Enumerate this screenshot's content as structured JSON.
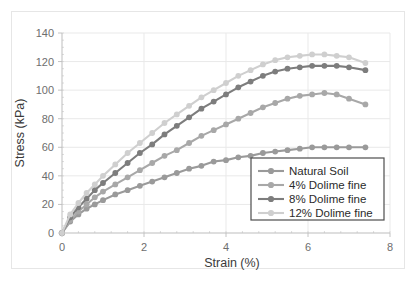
{
  "chart_data": {
    "type": "line",
    "title": "",
    "xlabel": "Strain (%)",
    "ylabel": "Stress (kPa)",
    "xlim": [
      0,
      8
    ],
    "ylim": [
      0,
      140
    ],
    "xticks": [
      0,
      2,
      4,
      6,
      8
    ],
    "yticks": [
      0,
      20,
      40,
      60,
      80,
      100,
      120,
      140
    ],
    "xtick_labels": [
      "0",
      "2",
      "4",
      "6",
      "8"
    ],
    "ytick_labels": [
      "0",
      "20",
      "40",
      "60",
      "80",
      "100",
      "120",
      "140"
    ],
    "grid": true,
    "legend_position": "lower-right",
    "markers": "circle",
    "series": [
      {
        "name": "Natural Soil",
        "color": "#9a9a9a",
        "x": [
          0,
          0.2,
          0.4,
          0.6,
          0.8,
          1.0,
          1.3,
          1.6,
          1.9,
          2.2,
          2.5,
          2.8,
          3.1,
          3.4,
          3.7,
          4.0,
          4.3,
          4.6,
          4.9,
          5.2,
          5.5,
          5.8,
          6.1,
          6.4,
          6.7,
          7.0,
          7.4
        ],
        "y": [
          0,
          8,
          13,
          17,
          20,
          23,
          27,
          30,
          33,
          36,
          39,
          42,
          45,
          47,
          50,
          51,
          53,
          54,
          56,
          57,
          58,
          59,
          60,
          60,
          60,
          60,
          60
        ]
      },
      {
        "name": "4% Dolime fine",
        "color": "#a8a8a8",
        "x": [
          0,
          0.2,
          0.4,
          0.6,
          0.8,
          1.0,
          1.3,
          1.6,
          1.9,
          2.2,
          2.5,
          2.8,
          3.1,
          3.4,
          3.7,
          4.0,
          4.3,
          4.6,
          4.9,
          5.2,
          5.5,
          5.8,
          6.1,
          6.4,
          6.7,
          7.0,
          7.4
        ],
        "y": [
          0,
          9,
          15,
          20,
          25,
          29,
          34,
          39,
          44,
          49,
          54,
          58,
          63,
          68,
          72,
          76,
          80,
          84,
          88,
          91,
          94,
          96,
          97,
          98,
          97,
          94,
          90
        ]
      },
      {
        "name": "8% Dolime fine",
        "color": "#7d7d7d",
        "x": [
          0,
          0.2,
          0.4,
          0.6,
          0.8,
          1.0,
          1.3,
          1.6,
          1.9,
          2.2,
          2.5,
          2.8,
          3.1,
          3.4,
          3.7,
          4.0,
          4.3,
          4.6,
          4.9,
          5.2,
          5.5,
          5.8,
          6.1,
          6.4,
          6.7,
          7.0,
          7.4
        ],
        "y": [
          0,
          11,
          18,
          24,
          30,
          35,
          42,
          49,
          56,
          62,
          69,
          75,
          81,
          87,
          92,
          97,
          102,
          106,
          110,
          113,
          115,
          116,
          117,
          117,
          117,
          116,
          114
        ]
      },
      {
        "name": "12% Dolime fine",
        "color": "#cfcfcf",
        "x": [
          0,
          0.2,
          0.4,
          0.6,
          0.8,
          1.0,
          1.3,
          1.6,
          1.9,
          2.2,
          2.5,
          2.8,
          3.1,
          3.4,
          3.7,
          4.0,
          4.3,
          4.6,
          4.9,
          5.2,
          5.5,
          5.8,
          6.1,
          6.4,
          6.7,
          7.0,
          7.4
        ],
        "y": [
          0,
          13,
          21,
          28,
          34,
          40,
          48,
          56,
          63,
          70,
          77,
          83,
          89,
          95,
          100,
          105,
          110,
          114,
          118,
          121,
          123,
          124,
          125,
          125,
          124,
          123,
          119
        ]
      }
    ]
  },
  "legend": {
    "entries": [
      {
        "label": "Natural Soil"
      },
      {
        "label": "4% Dolime fine"
      },
      {
        "label": "8% Dolime fine"
      },
      {
        "label": "12% Dolime fine"
      }
    ]
  }
}
